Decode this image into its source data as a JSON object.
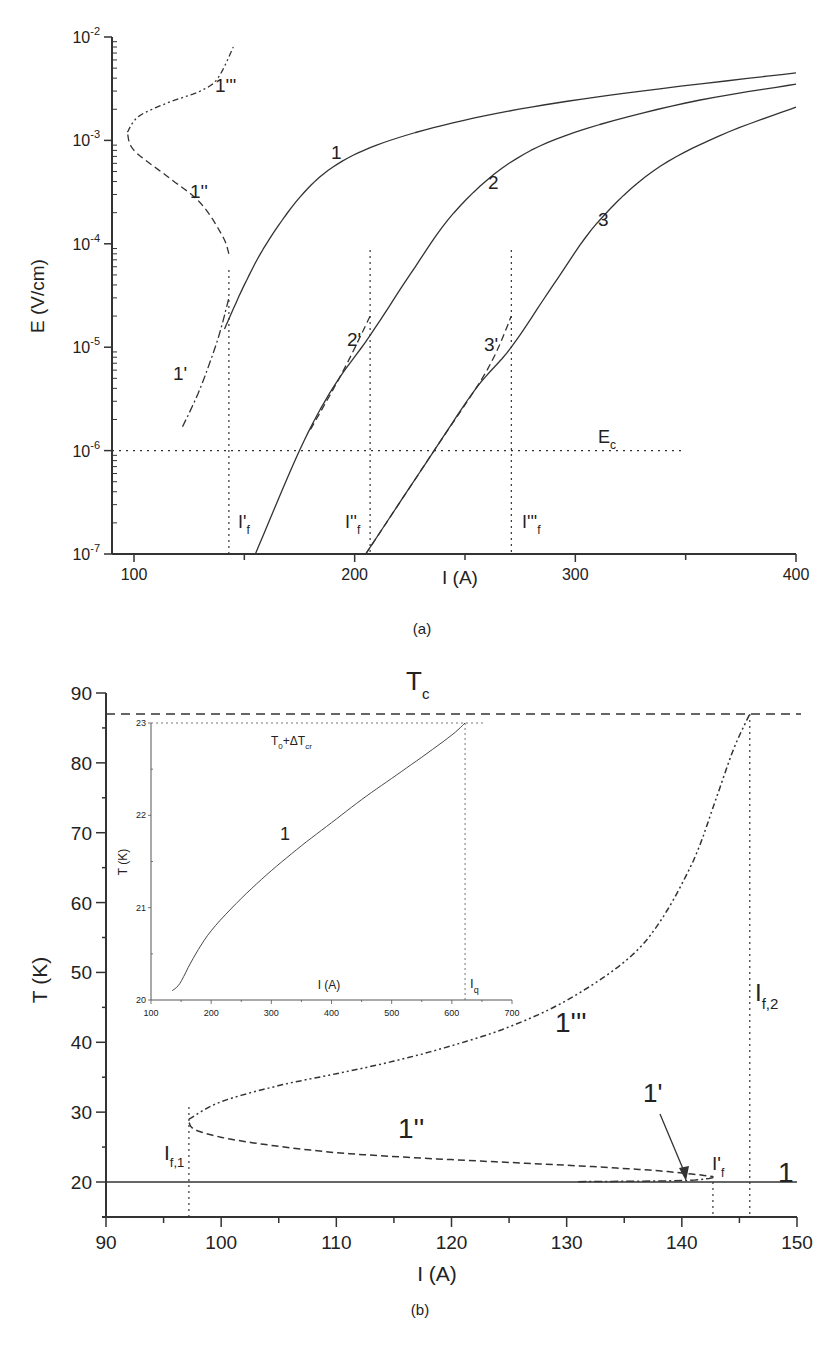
{
  "chart_data": [
    {
      "panel": "a",
      "type": "line",
      "caption": "(a)",
      "xlabel": "I (A)",
      "ylabel": "E (V/cm)",
      "yscale": "log",
      "xlim": [
        90,
        400
      ],
      "ylim": [
        1e-07,
        0.01
      ],
      "xticks": [
        "100",
        "200",
        "300",
        "400"
      ],
      "yticks": [
        "10-7",
        "10-6",
        "10-5",
        "10-4",
        "10-3",
        "10-2"
      ],
      "ytick_base": "10",
      "ytick_exps": [
        "-7",
        "-6",
        "-5",
        "-4",
        "-3",
        "-2"
      ],
      "annotations": {
        "Ec": {
          "text": "E",
          "sub": "c",
          "value": 1e-06,
          "x_range": [
            90,
            348
          ]
        },
        "If1": {
          "text": "I'",
          "sub": "f",
          "x": 143
        },
        "If2": {
          "text": "I''",
          "sub": "f",
          "x": 207
        },
        "If3": {
          "text": "I'''",
          "sub": "f",
          "x": 271
        }
      },
      "series": [
        {
          "name": "1",
          "style": "solid",
          "x": [
            141,
            150,
            160,
            175,
            190,
            210,
            240,
            280,
            330,
            400
          ],
          "y": [
            1.5e-05,
            4e-05,
            0.0001,
            0.00028,
            0.00055,
            0.0009,
            0.0014,
            0.0021,
            0.003,
            0.0045
          ]
        },
        {
          "name": "2",
          "style": "solid",
          "x": [
            155,
            175,
            190,
            207,
            225,
            245,
            270,
            300,
            350,
            400
          ],
          "y": [
            1e-07,
            1e-06,
            4e-06,
            1.3e-05,
            5e-05,
            0.0002,
            0.0006,
            0.0012,
            0.0023,
            0.0035
          ]
        },
        {
          "name": "3",
          "style": "solid",
          "x": [
            205,
            236,
            255,
            271,
            290,
            310,
            335,
            365,
            400
          ],
          "y": [
            1e-07,
            1e-06,
            4e-06,
            1e-05,
            4e-05,
            0.00016,
            0.0005,
            0.0011,
            0.0021
          ]
        },
        {
          "name": "1'",
          "style": "dash-dot",
          "x": [
            122,
            130,
            138,
            143
          ],
          "y": [
            1.7e-06,
            4e-06,
            1.2e-05,
            3e-05
          ]
        },
        {
          "name": "2'",
          "style": "dashed",
          "x": [
            180,
            195,
            207
          ],
          "y": [
            1.6e-06,
            6e-06,
            2e-05
          ]
        },
        {
          "name": "3'",
          "style": "dashed",
          "x": [
            205,
            236,
            260,
            271
          ],
          "y": [
            1e-07,
            1e-06,
            6e-06,
            2e-05
          ]
        },
        {
          "name": "1''",
          "style": "dashed",
          "x": [
            143,
            140,
            130,
            115,
            100,
            97
          ],
          "y": [
            8e-05,
            0.00012,
            0.00025,
            0.00045,
            0.0008,
            0.0012
          ]
        },
        {
          "name": "1'''",
          "style": "dash-dot-dot",
          "x": [
            97,
            102,
            115,
            130,
            138,
            145
          ],
          "y": [
            0.0012,
            0.0017,
            0.0023,
            0.003,
            0.004,
            0.008
          ]
        }
      ],
      "labels": [
        "1",
        "2",
        "3",
        "1'",
        "2'",
        "3'",
        "1''",
        "1'''"
      ]
    },
    {
      "panel": "b",
      "type": "line",
      "caption": "(b)",
      "xlabel": "I (A)",
      "ylabel": "T (K)",
      "xlim": [
        90,
        150
      ],
      "ylim": [
        15,
        90
      ],
      "xticks": [
        "90",
        "100",
        "110",
        "120",
        "130",
        "140",
        "150"
      ],
      "yticks": [
        "20",
        "30",
        "40",
        "50",
        "60",
        "70",
        "80",
        "90"
      ],
      "annotations": {
        "Tc": {
          "text": "T",
          "sub": "c",
          "value": 87
        },
        "If1": {
          "text": "I",
          "sub": "f,1",
          "x": 97.2
        },
        "Ifprime": {
          "text": "I'",
          "sub": "f",
          "x": 142.7
        },
        "If2": {
          "text": "I",
          "sub": "f,2",
          "x": 145.9
        },
        "arrow_1prime": {
          "text": "1'",
          "points_to": [
            140.2,
            20.4
          ]
        }
      },
      "series": [
        {
          "name": "1",
          "style": "solid",
          "x": [
            90,
            150
          ],
          "y": [
            20,
            20
          ]
        },
        {
          "name": "1'",
          "style": "dash-dot",
          "x": [
            131,
            140,
            142.7
          ],
          "y": [
            20.05,
            20.2,
            20.6
          ]
        },
        {
          "name": "1''",
          "style": "dashed",
          "x": [
            97.2,
            98,
            102,
            110,
            120,
            130,
            138,
            142.7
          ],
          "y": [
            28.5,
            27.3,
            25.8,
            24.2,
            23.2,
            22.4,
            21.6,
            20.8
          ]
        },
        {
          "name": "1'''",
          "style": "dash-dot-dot",
          "x": [
            97.2,
            100,
            105,
            110,
            115,
            120,
            125,
            130,
            135,
            138,
            141,
            143,
            144.5,
            145.9
          ],
          "y": [
            29,
            31.5,
            33.8,
            35.5,
            37.3,
            39.5,
            42.2,
            46,
            51.5,
            57,
            66,
            75,
            82,
            87
          ]
        }
      ],
      "labels": [
        "1",
        "1'",
        "1''",
        "1'''"
      ],
      "inset": {
        "type": "line",
        "xlabel": "I (A)",
        "ylabel": "T (K)",
        "xlim": [
          100,
          700
        ],
        "ylim": [
          20,
          23
        ],
        "xticks": [
          "100",
          "200",
          "300",
          "400",
          "500",
          "600",
          "700"
        ],
        "yticks": [
          "20",
          "21",
          "22",
          "23"
        ],
        "annotations": {
          "T0dTcr": {
            "text": "T",
            "sub0": "0",
            "mid": "+ΔT",
            "sub1": "cr",
            "value": 23
          },
          "Iq": {
            "text": "I",
            "sub": "q",
            "x": 622
          }
        },
        "series": [
          {
            "name": "1",
            "style": "solid",
            "x": [
              135,
              148,
              170,
              200,
              250,
              300,
              350,
              400,
              450,
              500,
              550,
              600,
              622
            ],
            "y": [
              20.1,
              20.18,
              20.45,
              20.75,
              21.1,
              21.4,
              21.67,
              21.92,
              22.17,
              22.4,
              22.63,
              22.87,
              23.0
            ]
          }
        ],
        "label": "1"
      }
    }
  ]
}
